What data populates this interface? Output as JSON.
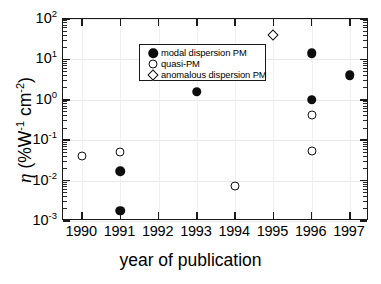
{
  "chart_data": {
    "type": "scatter",
    "title": "",
    "xlabel": "year of publication",
    "ylabel": "η (%W⁻¹ cm⁻²)",
    "ylabel_parts": {
      "symbol": "η",
      "open_paren": " (%W",
      "exp1": "-1",
      "mid": " cm",
      "exp2": "-2",
      "close_paren": ")"
    },
    "xlim": [
      1989.5,
      1997.5
    ],
    "ylim": [
      0.001,
      100
    ],
    "yscale": "log",
    "xscale": "linear",
    "grid": true,
    "legend_position": "upper left",
    "x_ticks": [
      "1990",
      "1991",
      "1992",
      "1993",
      "1994",
      "1995",
      "1996",
      "1997"
    ],
    "x_tick_values": [
      1990,
      1991,
      1992,
      1993,
      1994,
      1995,
      1996,
      1997
    ],
    "y_ticks": [
      {
        "mantissa": "10",
        "exponent": "2",
        "value": 100
      },
      {
        "mantissa": "10",
        "exponent": "1",
        "value": 10
      },
      {
        "mantissa": "10",
        "exponent": "0",
        "value": 1
      },
      {
        "mantissa": "10",
        "exponent": "-1",
        "value": 0.1
      },
      {
        "mantissa": "10",
        "exponent": "-2",
        "value": 0.01
      },
      {
        "mantissa": "10",
        "exponent": "-3",
        "value": 0.001
      }
    ],
    "series": [
      {
        "name": "modal dispersion PM",
        "marker": "filled-circle",
        "color": "#0d0d0d",
        "points": [
          {
            "x": 1991,
            "y": 0.017
          },
          {
            "x": 1991,
            "y": 0.0018
          },
          {
            "x": 1993,
            "y": 1.6
          },
          {
            "x": 1996,
            "y": 14
          },
          {
            "x": 1996,
            "y": 1.0
          },
          {
            "x": 1997,
            "y": 4.0
          }
        ]
      },
      {
        "name": "quasi-PM",
        "marker": "open-circle",
        "color": "#111111",
        "points": [
          {
            "x": 1990,
            "y": 0.04
          },
          {
            "x": 1991,
            "y": 0.05
          },
          {
            "x": 1994,
            "y": 0.0073
          },
          {
            "x": 1996,
            "y": 0.42
          },
          {
            "x": 1996,
            "y": 0.053
          }
        ]
      },
      {
        "name": "anomalous dispersion PM",
        "marker": "open-diamond",
        "color": "#111111",
        "points": [
          {
            "x": 1995,
            "y": 40
          }
        ]
      }
    ]
  },
  "legend": {
    "items": [
      {
        "label": "modal dispersion PM",
        "marker": "filled-circle"
      },
      {
        "label": "quasi-PM",
        "marker": "open-circle"
      },
      {
        "label": "anomalous dispersion PM",
        "marker": "open-diamond"
      }
    ]
  }
}
